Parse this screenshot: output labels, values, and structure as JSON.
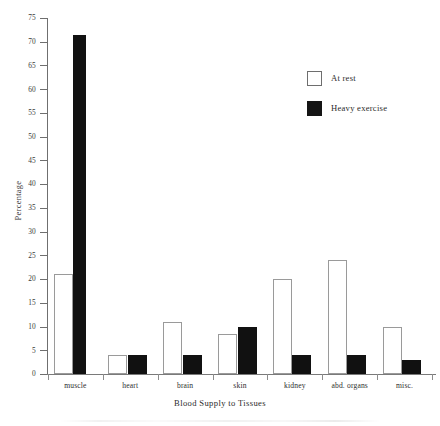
{
  "chart_data": {
    "type": "bar",
    "title": "",
    "xlabel": "Blood Supply to Tissues",
    "ylabel": "Percentage",
    "categories": [
      "muscle",
      "heart",
      "brain",
      "skin",
      "kidney",
      "abd. organs",
      "misc."
    ],
    "series": [
      {
        "name": "At rest",
        "color": "#ffffff",
        "values": [
          21,
          4,
          11,
          8.5,
          20,
          24,
          10
        ]
      },
      {
        "name": "Heavy exercise",
        "color": "#111111",
        "values": [
          71.5,
          4,
          4,
          10,
          4,
          4,
          3
        ]
      }
    ],
    "ylim": [
      0,
      75
    ],
    "ytick_step": 5,
    "ytick_labels": [
      "0",
      "5",
      "10",
      "15",
      "20",
      "25",
      "30",
      "35",
      "40",
      "45",
      "50",
      "55",
      "60",
      "65",
      "70",
      "75"
    ],
    "grid": false,
    "legend_position": "upper right"
  },
  "legend": {
    "entries": [
      {
        "label": "At rest",
        "swatch": "white-square-icon"
      },
      {
        "label": "Heavy exercise",
        "swatch": "black-square-icon"
      }
    ]
  },
  "axes": {
    "y_title": "Percentage",
    "x_title": "Blood Supply to Tissues"
  }
}
